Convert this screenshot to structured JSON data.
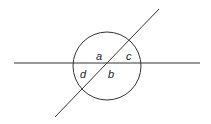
{
  "diagram": {
    "labels": {
      "a": "a",
      "b": "b",
      "c": "c",
      "d": "d"
    },
    "circle": {
      "cx": 107,
      "cy": 66,
      "r": 34
    },
    "horizontal_line": {
      "x1": 14,
      "y1": 63,
      "x2": 200,
      "y2": 63
    },
    "diagonal_line": {
      "x1": 55,
      "y1": 117,
      "x2": 159,
      "y2": 9
    },
    "stroke_color": "#333333"
  }
}
